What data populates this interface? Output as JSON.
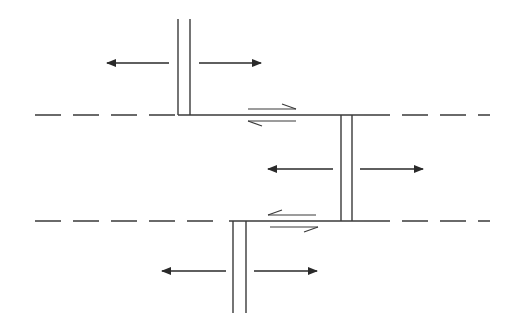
{
  "diagram": {
    "type": "plate-tectonics schematic",
    "colors": {
      "background": "#ffffff",
      "line": "#3a3a3a"
    },
    "fracture_zones": [
      {
        "name": "upper-fracture-zone",
        "y": 115,
        "style": "dashed"
      },
      {
        "name": "lower-fracture-zone",
        "y": 221,
        "style": "dashed"
      }
    ],
    "ridge_segments": [
      {
        "name": "upper-ridge",
        "x_left": 178,
        "x_right": 190,
        "y_top": 19,
        "y_bottom": 115
      },
      {
        "name": "middle-ridge",
        "x_left": 341,
        "x_right": 352,
        "y_top": 115,
        "y_bottom": 221
      },
      {
        "name": "lower-ridge",
        "x_left": 233,
        "x_right": 246,
        "y_top": 221,
        "y_bottom": 313
      }
    ],
    "transform_faults": [
      {
        "name": "upper-transform-fault",
        "y": 115,
        "x_start": 178,
        "x_end": 352,
        "upper_motion": "right",
        "lower_motion": "left"
      },
      {
        "name": "lower-transform-fault",
        "y": 221,
        "x_start": 233,
        "x_end": 352,
        "upper_motion": "left",
        "lower_motion": "right"
      }
    ],
    "spreading_arrows": [
      {
        "name": "upper-ridge-left-arrow",
        "y": 63,
        "from": 169,
        "to": 107
      },
      {
        "name": "upper-ridge-right-arrow",
        "y": 63,
        "from": 199,
        "to": 261
      },
      {
        "name": "middle-ridge-left-arrow",
        "y": 169,
        "from": 333,
        "to": 268
      },
      {
        "name": "middle-ridge-right-arrow",
        "y": 169,
        "from": 360,
        "to": 423
      },
      {
        "name": "lower-ridge-left-arrow",
        "y": 271,
        "from": 226,
        "to": 162
      },
      {
        "name": "lower-ridge-right-arrow",
        "y": 271,
        "from": 254,
        "to": 317
      }
    ],
    "labels": []
  }
}
